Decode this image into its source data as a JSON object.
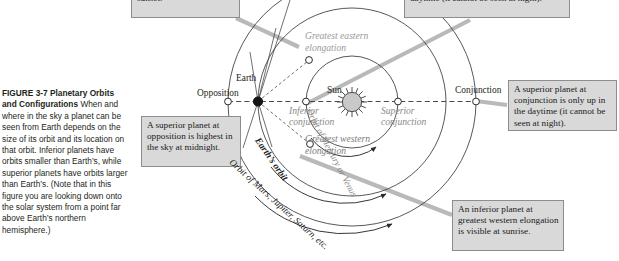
{
  "figure": {
    "number": "FIGURE 3-7",
    "title": "Planetary Orbits and Configurations",
    "caption": "When and where in the sky a planet can be seen from Earth depends on the size of its orbit and its location on that orbit. Inferior planets have orbits smaller than Earth’s, while superior planets have orbits larger than Earth’s. (Note that in this figure you are looking down onto the solar system from a point far above Earth’s northern hemisphere.)"
  },
  "callouts": {
    "greatest_eastern": "elongation is visible at sunset.",
    "superior_conjunction": "or superior conjunction is only up in the daytime (it cannot be seen at night).",
    "opposition": "A superior planet at opposition is highest in the sky at midnight.",
    "conjunction": "A superior planet at conjunction is only up in the daytime (it cannot be seen at night).",
    "greatest_western": "An inferior planet at greatest western elongation is visible at sunrise."
  },
  "diagram": {
    "labels": {
      "sun": "Sun",
      "earth": "Earth",
      "opposition": "Opposition",
      "conjunction": "Conjunction",
      "inferior_conjunction": "Inferior conjunction",
      "superior_conjunction": "Superior conjunction",
      "greatest_eastern_elongation": "Greatest eastern elongation",
      "greatest_western_elongation": "Greatest western elongation"
    },
    "orbit_labels": {
      "inner": "Orbit of Mercury or Venus",
      "earth": "Earth’s orbit",
      "outer": "Orbit of Mars, Jupiter, Saturn, etc."
    },
    "colors": {
      "sun_fill": "#c9c9c9",
      "earth_fill": "#1a1a1a",
      "orbit_stroke": "#333333",
      "gray_label": "#8a8a8a",
      "callout_fill": "#d9d9d9",
      "callout_border": "#8d8d8d",
      "leader_line": "#b5b5b5"
    }
  }
}
